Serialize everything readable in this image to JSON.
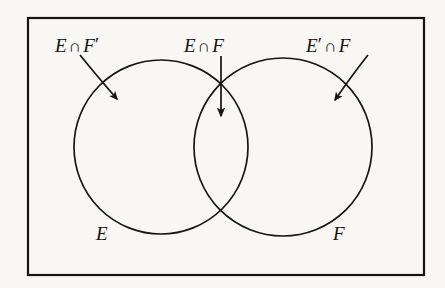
{
  "figure": {
    "kind": "venn-diagram",
    "background_color": "#f8f7f3",
    "ink_color": "#151515"
  },
  "frame": {
    "name": "universal-set-rectangle",
    "x": 27,
    "y": 17,
    "width": 398,
    "height": 259,
    "stroke_width": 2
  },
  "circles": [
    {
      "name": "set-e-circle",
      "label": "E",
      "cx": 161,
      "cy": 147,
      "r": 87
    },
    {
      "name": "set-f-circle",
      "label": "F",
      "cx": 283,
      "cy": 147,
      "r": 89
    }
  ],
  "labels": {
    "e_and_not_f": {
      "set": "E",
      "op": "∩",
      "set2": "F",
      "prime": "′",
      "text": "E ∩ F′"
    },
    "e_and_f": {
      "set": "E",
      "op": "∩",
      "set2": "F",
      "text": "E ∩ F"
    },
    "not_e_and_f": {
      "set": "E",
      "prime": "′",
      "op": "∩",
      "set2": "F",
      "text": "E′ ∩ F"
    },
    "set_e": {
      "text": "E"
    },
    "set_f": {
      "text": "F"
    }
  },
  "annotations": [
    {
      "name": "arrow-to-e-only-region",
      "points_to": "E ∩ F′",
      "style": "curved",
      "start": [
        82,
        56
      ],
      "end": [
        121,
        103
      ]
    },
    {
      "name": "arrow-to-intersection-region",
      "points_to": "E ∩ F",
      "style": "straight-vertical",
      "start": [
        221,
        57
      ],
      "end": [
        221,
        121
      ]
    },
    {
      "name": "arrow-to-f-only-region",
      "points_to": "E′ ∩ F",
      "style": "curved",
      "start": [
        366,
        56
      ],
      "end": [
        331,
        104
      ]
    }
  ]
}
